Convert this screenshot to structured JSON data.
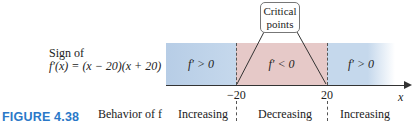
{
  "figure": {
    "label": "FIGURE 4.38"
  },
  "sign_label": {
    "line1": "Sign of",
    "line2": "f′(x) = (x − 20)(x + 20)"
  },
  "behavior_label": "Behavior of f",
  "callout": {
    "line1": "Critical",
    "line2": "points"
  },
  "axis": {
    "variable": "x",
    "ticks": [
      "−20",
      "20"
    ]
  },
  "regions": [
    {
      "sign": "f′ > 0",
      "behavior": "Increasing",
      "color": "#c5d8ec"
    },
    {
      "sign": "f′ < 0",
      "behavior": "Decreasing",
      "color": "#e6c9c8"
    },
    {
      "sign": "f′ > 0",
      "behavior": "Increasing",
      "color": "#c5d8ec"
    }
  ],
  "colors": {
    "figure_label": "#2a78c8",
    "positive": "#c5d8ec",
    "negative": "#e6c9c8"
  }
}
